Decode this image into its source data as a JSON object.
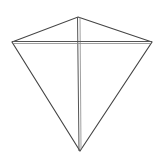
{
  "diagram": {
    "colors": {
      "background": "#ffffff",
      "stroke": "#444444",
      "spar": "#777777"
    },
    "vertices": {
      "top": [
        78,
        17
      ],
      "left": [
        12,
        42
      ],
      "right": [
        152,
        42
      ],
      "bottom": [
        80,
        151
      ]
    }
  }
}
